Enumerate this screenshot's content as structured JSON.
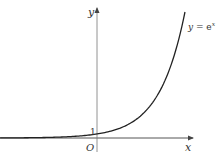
{
  "chart_data": {
    "type": "line",
    "title": "",
    "xlabel": "x",
    "ylabel": "y",
    "origin_label": "O",
    "annotations": [
      {
        "text": "y = e^x",
        "position": "upper-right near curve end"
      },
      {
        "text": "1",
        "position": "y-intercept of curve"
      }
    ],
    "series": [
      {
        "name": "y = e^x",
        "function": "exp(x)",
        "x": [
          -3.8,
          -3,
          -2,
          -1,
          0,
          1,
          2,
          3,
          3.45
        ],
        "values": [
          0.02,
          0.05,
          0.14,
          0.37,
          1,
          2.72,
          7.39,
          20.09,
          31.5
        ]
      }
    ],
    "xlim": [
      -3.8,
      3.8
    ],
    "ylim": [
      -0.5,
      32
    ],
    "grid": false,
    "legend": "none",
    "colors": {
      "curve": "#222222",
      "axes": "#555555",
      "text": "#333333"
    }
  },
  "labels": {
    "y_axis": "y",
    "x_axis": "x",
    "origin": "O",
    "intercept": "1",
    "curve_name_y": "y",
    "curve_name_eq": " = e",
    "curve_name_exp": "x"
  }
}
